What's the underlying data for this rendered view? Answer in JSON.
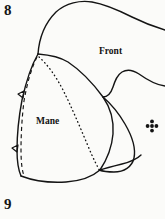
{
  "figure": {
    "top_number": "8",
    "bottom_number": "9",
    "ink_color": "#141414",
    "paper_color": "#fbfbf9"
  },
  "labels": {
    "front": "Front",
    "mane": "Mane"
  },
  "markers": {
    "grain_marker": "four-petal-registration-marker",
    "notch_upper": "notch-mark",
    "notch_lower": "notch-mark"
  },
  "lines": {
    "solid": "solid-outline",
    "dashed": "dashed-seam-line",
    "dotted": "dotted-fold-line"
  }
}
